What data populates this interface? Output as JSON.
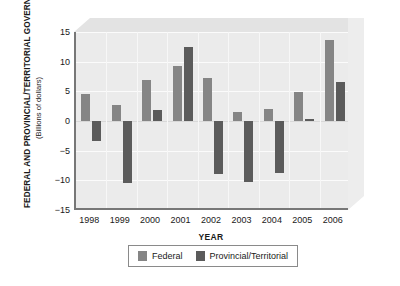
{
  "chart_data": {
    "type": "bar",
    "title": "FEDERAL AND PROVINCIAL/TERRITORIAL GOVERNMENTS 1998–2006",
    "subtitle": "(Billions of dollars)",
    "xlabel": "YEAR",
    "ylabel": "FEDERAL AND PROVINCIAL/TERRITORIAL GOVERNMENTS 1998–2006 (Billions of dollars)",
    "categories": [
      "1998",
      "1999",
      "2000",
      "2001",
      "2002",
      "2003",
      "2004",
      "2005",
      "2006"
    ],
    "series": [
      {
        "name": "Federal",
        "color": "#858585",
        "values": [
          4.6,
          2.7,
          6.9,
          9.2,
          7.3,
          1.6,
          2.1,
          4.9,
          13.7
        ]
      },
      {
        "name": "Provincial/Territorial",
        "color": "#5b5b5b",
        "values": [
          -3.3,
          -10.4,
          1.9,
          12.4,
          -9.0,
          -10.3,
          -8.8,
          0.3,
          6.6
        ]
      }
    ],
    "ylim": [
      -15,
      15
    ],
    "yticks": [
      15,
      10,
      5,
      0,
      -5,
      -10,
      -15
    ],
    "ytick_labels": [
      "15",
      "10",
      "5",
      "0",
      "−5",
      "−10",
      "−15"
    ],
    "grid": true,
    "legend_position": "bottom"
  },
  "legend": {
    "items": [
      {
        "label": "Federal",
        "swatch": "federal-swatch"
      },
      {
        "label": "Provincial/Territorial",
        "swatch": "provincial-swatch"
      }
    ]
  }
}
